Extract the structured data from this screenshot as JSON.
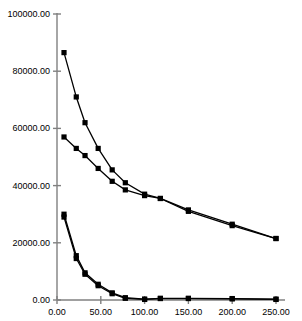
{
  "chart_data": {
    "type": "line",
    "title": "",
    "subtitle": "",
    "xlabel": "",
    "ylabel": "",
    "xlim": [
      0,
      250
    ],
    "ylim": [
      0,
      100000
    ],
    "grid": false,
    "legend": "none",
    "marker": "square",
    "line_color": "#000000",
    "marker_color": "#000000",
    "axis_color": "#808080",
    "background": "#ffffff",
    "xticks": [
      0,
      50,
      100,
      150,
      200,
      250
    ],
    "xtick_labels": [
      "0.00",
      "50.00",
      "100.00",
      "150.00",
      "200.00",
      "250.00"
    ],
    "yticks": [
      0,
      20000,
      40000,
      60000,
      80000,
      100000
    ],
    "ytick_labels": [
      "0.00",
      "20000.00",
      "40000.00",
      "60000.00",
      "80000.00",
      "100000.00"
    ],
    "series": [
      {
        "name": "series-1",
        "x": [
          8,
          22,
          32,
          47,
          63,
          78,
          100,
          118,
          150,
          200,
          250
        ],
        "y": [
          86500,
          71000,
          62000,
          53000,
          45500,
          41000,
          37000,
          35500,
          31500,
          26500,
          21500
        ]
      },
      {
        "name": "series-2",
        "x": [
          8,
          22,
          32,
          47,
          63,
          78,
          100,
          118,
          150,
          200,
          250
        ],
        "y": [
          57000,
          53000,
          50500,
          46000,
          41500,
          38500,
          36500,
          35500,
          31000,
          26000,
          21500
        ]
      },
      {
        "name": "series-3",
        "x": [
          8,
          22,
          32,
          47,
          63,
          78,
          100,
          118,
          150,
          200,
          250
        ],
        "y": [
          30000,
          15500,
          9500,
          5500,
          2500,
          800,
          300,
          600,
          600,
          500,
          300
        ]
      },
      {
        "name": "series-4",
        "x": [
          8,
          22,
          32,
          47,
          63,
          78,
          100,
          118,
          150,
          200,
          250
        ],
        "y": [
          29000,
          14500,
          9000,
          5000,
          2200,
          600,
          200,
          500,
          500,
          400,
          200
        ]
      }
    ]
  }
}
